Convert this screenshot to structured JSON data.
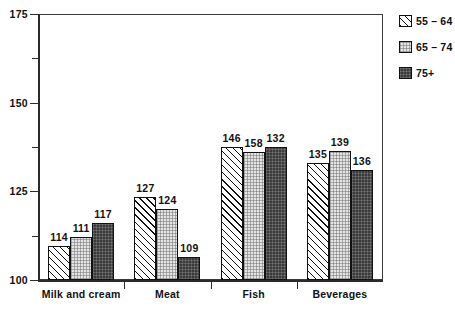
{
  "chart_data": {
    "type": "bar",
    "title": "",
    "subtitle": "",
    "xlabel": "",
    "ylabel": "",
    "ylim": [
      100,
      175
    ],
    "y_major_ticks": [
      100,
      125,
      150,
      175
    ],
    "y_minor_ticks": [
      112.5,
      137.5,
      162.5
    ],
    "y_tick_labels": [
      "100",
      "125",
      "150",
      "175"
    ],
    "grid": false,
    "legend_position": "right",
    "categories": [
      "Milk and cream",
      "Meat",
      "Fish",
      "Beverages"
    ],
    "series": [
      {
        "name": "55 – 64",
        "pattern": "diagonal-hatch",
        "color": "#ffffff",
        "values": [
          114,
          127,
          146,
          135
        ],
        "labels": [
          "114",
          "127",
          "146",
          "135"
        ],
        "plotted_heights": [
          109.5,
          123.5,
          137.5,
          133.0
        ]
      },
      {
        "name": "65 – 74",
        "pattern": "light-stipple",
        "color": "#e4e4e4",
        "values": [
          111,
          124,
          158,
          139
        ],
        "labels": [
          "111",
          "124",
          "158",
          "139"
        ],
        "plotted_heights": [
          112.0,
          120.0,
          136.0,
          136.5
        ]
      },
      {
        "name": "75+",
        "pattern": "dark-checker",
        "color": "#3a3a3a",
        "values": [
          117,
          109,
          132,
          136
        ],
        "labels": [
          "117",
          "109",
          "132",
          "136"
        ],
        "plotted_heights": [
          116.0,
          106.5,
          137.5,
          131.0
        ]
      }
    ]
  },
  "legend": {
    "items": [
      {
        "label": "55 – 64"
      },
      {
        "label": "65 – 74"
      },
      {
        "label": "75+"
      }
    ]
  },
  "axis": {
    "y_labels": [
      "175",
      "150",
      "125",
      "100"
    ]
  }
}
